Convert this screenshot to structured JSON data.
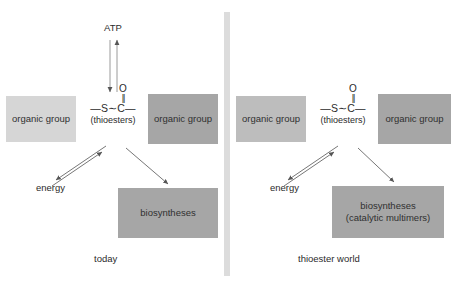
{
  "figure": {
    "divider_color": "#dcdcdc",
    "background": "#ffffff"
  },
  "palette": {
    "box_light": "#d6d6d6",
    "box_mid": "#bdbdbd",
    "box_dark": "#a6a6a6",
    "text": "#2b2b2b",
    "arrow": "#555555"
  },
  "formula": {
    "oxygen": "O",
    "double_bond": "||",
    "backbone": "—S∼C—",
    "sublabel": "(thioesters)"
  },
  "panels": [
    {
      "id": "today",
      "caption": "today",
      "left_group": {
        "label": "organic group",
        "tone": "light"
      },
      "right_group": {
        "label": "organic group",
        "tone": "dark"
      },
      "top_node": {
        "label": "ATP",
        "arrow": "bidirectional-vertical"
      },
      "energy": {
        "label": "energy",
        "arrow": "reversible-pair"
      },
      "biosyntheses": {
        "line1": "biosyntheses",
        "line2": "",
        "tone": "dark",
        "arrow": "one-way"
      }
    },
    {
      "id": "thioester-world",
      "caption": "thioester world",
      "left_group": {
        "label": "organic group",
        "tone": "mid"
      },
      "right_group": {
        "label": "organic group",
        "tone": "dark"
      },
      "top_node": {
        "label": "",
        "arrow": "none"
      },
      "energy": {
        "label": "energy",
        "arrow": "reversible-pair"
      },
      "biosyntheses": {
        "line1": "biosyntheses",
        "line2": "(catalytic multimers)",
        "tone": "dark",
        "arrow": "one-way"
      }
    }
  ]
}
